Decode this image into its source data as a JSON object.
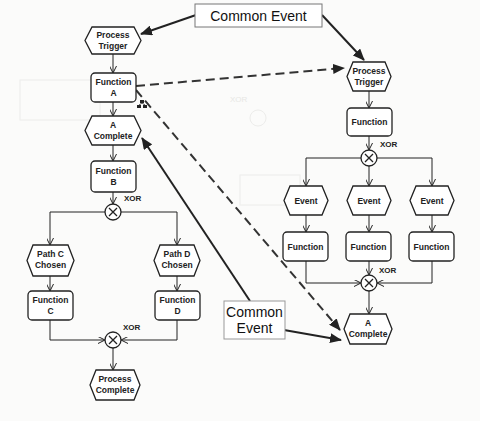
{
  "diagram": {
    "type": "EPC process diagram",
    "left_process": {
      "process_trigger": [
        "Process",
        "Trigger"
      ],
      "function_a": [
        "Function",
        "A"
      ],
      "a_complete": [
        "A",
        "Complete"
      ],
      "function_b": [
        "Function",
        "B"
      ],
      "xor_split": "XOR",
      "path_c_chosen": [
        "Path C",
        "Chosen"
      ],
      "path_d_chosen": [
        "Path D",
        "Chosen"
      ],
      "function_c": [
        "Function",
        "C"
      ],
      "function_d": [
        "Function",
        "D"
      ],
      "xor_join": "XOR",
      "process_complete": [
        "Process",
        "Complete"
      ]
    },
    "right_process": {
      "process_trigger": [
        "Process",
        "Trigger"
      ],
      "function": "Function",
      "xor_split": "XOR",
      "events": [
        "Event",
        "Event",
        "Event"
      ],
      "functions": [
        "Function",
        "Function",
        "Function"
      ],
      "xor_join": "XOR",
      "a_complete": [
        "A",
        "Complete"
      ]
    },
    "annotations": {
      "common_event_top": "Common Event",
      "common_event_bottom": [
        "Common",
        "Event"
      ]
    },
    "icons": {
      "subprocess_icon": "hierarchy-icon"
    },
    "colors": {
      "line": "#222222",
      "background": "#fbfbfa",
      "shape_fill": "#ffffff"
    }
  }
}
